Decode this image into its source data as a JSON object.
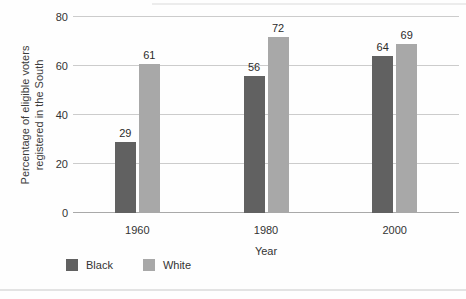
{
  "chart_data": {
    "type": "bar",
    "title": "",
    "categories": [
      "1960",
      "1980",
      "2000"
    ],
    "series": [
      {
        "name": "Black",
        "color": "#616161",
        "values": [
          29,
          56,
          64
        ]
      },
      {
        "name": "White",
        "color": "#a8a8a8",
        "values": [
          61,
          72,
          69
        ]
      }
    ],
    "xlabel": "Year",
    "ylabel_lines": [
      "Percentage of eligible voters",
      "registered in the South"
    ],
    "yticks": [
      0,
      20,
      40,
      60,
      80
    ],
    "ylim": [
      0,
      80
    ],
    "grid": true,
    "value_labels_shown": true,
    "legend_position": "bottom-left"
  },
  "colors": {
    "gridline": "#cccccc",
    "baseline": "#a9a9a9",
    "bar_black": "#616161",
    "bar_white": "#a8a8a8"
  }
}
